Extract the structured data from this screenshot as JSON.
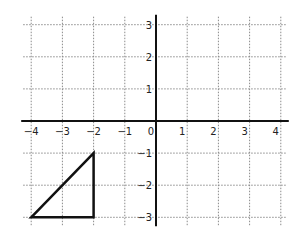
{
  "chart_data": {
    "type": "line",
    "title": "",
    "xlabel": "",
    "ylabel": "",
    "xlim": [
      -4,
      4
    ],
    "ylim": [
      -3,
      3
    ],
    "grid": true,
    "x_ticks": [
      -4,
      -3,
      -2,
      -1,
      0,
      1,
      2,
      3,
      4
    ],
    "y_ticks": [
      -3,
      -2,
      -1,
      1,
      2,
      3
    ],
    "x_tick_labels": [
      "−4",
      "−3",
      "−2",
      "−1",
      "0",
      "1",
      "2",
      "3",
      "4"
    ],
    "y_tick_labels": [
      "−3",
      "−2",
      "−1",
      "1",
      "2",
      "3"
    ],
    "series": [
      {
        "name": "triangle",
        "closed": true,
        "points": [
          {
            "x": -4,
            "y": -3
          },
          {
            "x": -2,
            "y": -1
          },
          {
            "x": -2,
            "y": -3
          }
        ]
      }
    ],
    "colors": {
      "axis": "#111111",
      "grid": "#8a8a8a",
      "shape": "#111111"
    }
  }
}
